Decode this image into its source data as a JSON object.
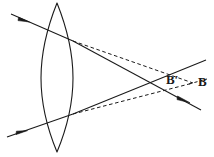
{
  "figure": {
    "width": 214,
    "height": 157,
    "background_color": "#ffffff",
    "stroke_color": "#1a1a1a",
    "labels": [
      {
        "id": "b-prime",
        "text": "B′",
        "x": 166,
        "y": 73
      },
      {
        "id": "b",
        "text": "B",
        "x": 198,
        "y": 75
      }
    ],
    "lens": {
      "name": "biconvex-lens",
      "apex_top": {
        "x": 57,
        "y": 3
      },
      "apex_bottom": {
        "x": 57,
        "y": 152
      },
      "left_edge_x": 41,
      "right_edge_x": 73,
      "mid_y": 78
    },
    "rays": {
      "incoming_upper": {
        "style": "solid",
        "from": {
          "x": 11,
          "y": 14
        },
        "to": {
          "x": 73,
          "y": 41
        },
        "arrow_at": {
          "x": 26,
          "y": 20
        }
      },
      "incoming_lower": {
        "style": "solid",
        "from": {
          "x": 7,
          "y": 137
        },
        "to": {
          "x": 73,
          "y": 114
        },
        "arrow_at": {
          "x": 23,
          "y": 131
        }
      },
      "refracted_upper_solid": {
        "style": "solid",
        "from": {
          "x": 73,
          "y": 41
        },
        "to": {
          "x": 201,
          "y": 110
        },
        "arrow_at": {
          "x": 186,
          "y": 102
        }
      },
      "refracted_lower_solid": {
        "style": "solid",
        "from": {
          "x": 73,
          "y": 114
        },
        "to": {
          "x": 206,
          "y": 60
        }
      },
      "refracted_upper_dashed": {
        "style": "dashed",
        "from": {
          "x": 73,
          "y": 41
        },
        "to": {
          "x": 193,
          "y": 83
        }
      },
      "refracted_lower_dashed": {
        "style": "dashed",
        "from": {
          "x": 73,
          "y": 114
        },
        "to": {
          "x": 193,
          "y": 83
        }
      },
      "dashed_tail_right": {
        "style": "dashed",
        "from": {
          "x": 193,
          "y": 83
        },
        "to": {
          "x": 206,
          "y": 79
        }
      }
    },
    "focus_points": {
      "solid_crossing": {
        "x": 160,
        "y": 79
      },
      "dashed_crossing": {
        "x": 193,
        "y": 83
      }
    }
  }
}
